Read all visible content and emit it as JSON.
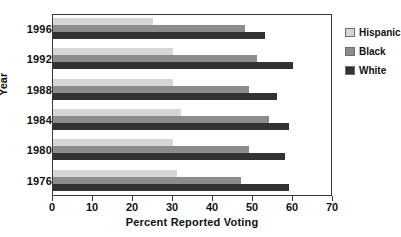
{
  "chart_data": {
    "type": "bar",
    "orientation": "horizontal",
    "title": "",
    "xlabel": "Percent Reported Voting",
    "ylabel": "Year",
    "xlim": [
      0,
      70
    ],
    "xticks": [
      0,
      10,
      20,
      30,
      40,
      50,
      60,
      70
    ],
    "grid": false,
    "legend_position": "right",
    "categories": [
      "1996",
      "1992",
      "1988",
      "1984",
      "1980",
      "1976"
    ],
    "series": [
      {
        "name": "Hispanic",
        "color": "#d6d6d6",
        "values": [
          25,
          30,
          30,
          32,
          30,
          31
        ]
      },
      {
        "name": "Black",
        "color": "#8c8c8c",
        "values": [
          48,
          51,
          49,
          54,
          49,
          47
        ]
      },
      {
        "name": "White",
        "color": "#333333",
        "values": [
          53,
          60,
          56,
          59,
          58,
          59
        ]
      }
    ]
  },
  "axes": {
    "x": {
      "title": "Percent Reported Voting",
      "ticklabels": [
        "0",
        "10",
        "20",
        "30",
        "40",
        "50",
        "60",
        "70"
      ]
    },
    "y": {
      "title": "Year",
      "ticklabels": [
        "1996",
        "1992",
        "1988",
        "1984",
        "1980",
        "1976"
      ]
    }
  },
  "legend": {
    "items": [
      {
        "label": "Hispanic",
        "color": "#d6d6d6"
      },
      {
        "label": "Black",
        "color": "#8c8c8c"
      },
      {
        "label": "White",
        "color": "#333333"
      }
    ]
  }
}
